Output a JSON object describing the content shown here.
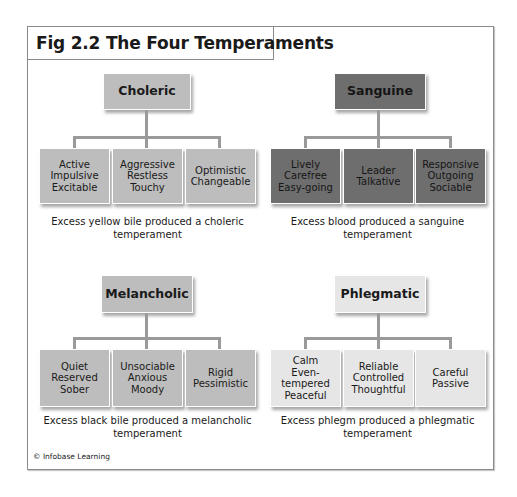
{
  "figure": {
    "title": "Fig 2.2 The Four Temperaments",
    "credit": "© Infobase Learning"
  },
  "temperaments": [
    {
      "name": "Choleric",
      "shade": "light",
      "traits": [
        "Active\nImpulsive\nExcitable",
        "Aggressive\nRestless\nTouchy",
        "Optimistic\nChangeable"
      ],
      "caption": "Excess yellow bile produced a choleric\ntemperament"
    },
    {
      "name": "Sanguine",
      "shade": "dark",
      "traits": [
        "Lively\nCarefree\nEasy-going",
        "Leader\nTalkative",
        "Responsive\nOutgoing\nSociable"
      ],
      "caption": "Excess blood produced a sanguine\ntemperament"
    },
    {
      "name": "Melancholic",
      "shade": "light",
      "traits": [
        "Quiet\nReserved\nSober",
        "Unsociable\nAnxious\nMoody",
        "Rigid\nPessimistic"
      ],
      "caption": "Excess black bile produced a melancholic\ntemperament"
    },
    {
      "name": "Phlegmatic",
      "shade": "lighter",
      "traits": [
        "Calm\nEven-\ntempered\nPeaceful",
        "Reliable\nControlled\nThoughtful",
        "Careful\nPassive"
      ],
      "caption": "Excess phlegm produced a phlegmatic\ntemperament"
    }
  ],
  "colors": {
    "light_box": "#bdbdbd",
    "dark_box": "#6e6e6e",
    "lighter_box": "#e6e6e6",
    "connector": "#9a9a9a",
    "frame_border": "#8a8a8a"
  }
}
